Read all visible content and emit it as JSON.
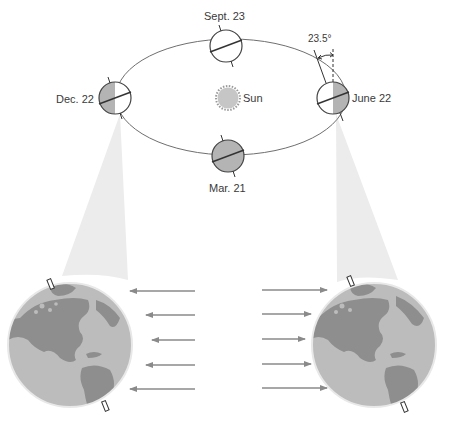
{
  "diagram": {
    "orbit": {
      "cx": 231,
      "cy": 97,
      "rx": 115,
      "ry": 58,
      "stroke": "#6f6f6f"
    },
    "sun": {
      "label": "Sun",
      "cx": 228,
      "cy": 98,
      "r": 11,
      "fill": "#c6c6c6",
      "edge": "#8c8c8c"
    },
    "tilt_annotation": {
      "label": "23.5°",
      "degrees": 23.5
    },
    "positions": [
      {
        "id": "dec",
        "label": "Dec. 22",
        "cx": 115,
        "cy": 98,
        "r": 16,
        "shading": "left-half"
      },
      {
        "id": "sep",
        "label": "Sept. 23",
        "cx": 226,
        "cy": 46,
        "r": 16,
        "shading": "none"
      },
      {
        "id": "jun",
        "label": "June 22",
        "cx": 333,
        "cy": 98,
        "r": 16,
        "shading": "right-half"
      },
      {
        "id": "mar",
        "label": "Mar. 21",
        "cx": 228,
        "cy": 156,
        "r": 16,
        "shading": "full"
      }
    ],
    "enlarged_globes": [
      {
        "id": "left-globe",
        "represents": "Dec. 22",
        "cx": 70,
        "cy": 345,
        "r": 62,
        "sunlight_arrows_direction": "left"
      },
      {
        "id": "right-globe",
        "represents": "June 22",
        "cx": 374,
        "cy": 345,
        "r": 62,
        "sunlight_arrows_direction": "right"
      }
    ],
    "arrows": {
      "left_group": [
        {
          "x1": 195,
          "x2": 130,
          "y": 291
        },
        {
          "x1": 195,
          "x2": 146,
          "y": 315
        },
        {
          "x1": 195,
          "x2": 152,
          "y": 340
        },
        {
          "x1": 195,
          "x2": 146,
          "y": 365
        },
        {
          "x1": 195,
          "x2": 130,
          "y": 389
        }
      ],
      "right_group": [
        {
          "x1": 262,
          "x2": 327,
          "y": 290
        },
        {
          "x1": 262,
          "x2": 311,
          "y": 314
        },
        {
          "x1": 262,
          "x2": 305,
          "y": 339
        },
        {
          "x1": 262,
          "x2": 311,
          "y": 364
        },
        {
          "x1": 262,
          "x2": 327,
          "y": 388
        }
      ],
      "color": "#8a8a8a"
    },
    "colors": {
      "globe_shade": "#b4b4b4",
      "globe_light": "#ffffff",
      "globe_outline": "#444444",
      "ocean": "#bcbcbc",
      "land": "#8e8e8e",
      "beam": "#ececec"
    }
  }
}
